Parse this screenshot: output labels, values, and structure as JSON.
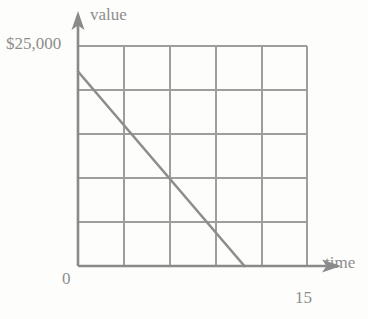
{
  "chart_data": {
    "type": "line",
    "title": "",
    "xlabel": "time",
    "ylabel": "value",
    "grid": true,
    "legend": false,
    "xlim": [
      0,
      15
    ],
    "ylim": [
      0,
      25000
    ],
    "x_tick_labels": [
      "0",
      "15"
    ],
    "y_tick_labels": [
      "$25,000"
    ],
    "y_axis_max_label": "$25,000",
    "x_axis_max_label": "15",
    "origin_label": "0",
    "grid_columns": 5,
    "grid_rows": 5,
    "x_gridline_values": [
      0,
      3,
      6,
      9,
      12,
      15
    ],
    "y_gridline_values": [
      0,
      5000,
      10000,
      15000,
      20000,
      25000
    ],
    "series": [
      {
        "name": "value",
        "points": [
          {
            "x": 0,
            "y": 22100
          },
          {
            "x": 10.9,
            "y": 0
          }
        ],
        "values": [
          22100,
          0
        ],
        "x": [
          0,
          10.9
        ],
        "style": "solid-straight-line"
      }
    ],
    "annotations": []
  },
  "labels": {
    "y_axis_name": "value",
    "x_axis_name": "time",
    "y_axis_max": "$25,000",
    "origin": "0",
    "x_axis_max": "15"
  },
  "colors": {
    "line": "#8d8d8d",
    "grid": "#9a9a9a",
    "axis": "#8a8a8a",
    "text": "#8d8d8d",
    "background": "#fdfdfb"
  }
}
